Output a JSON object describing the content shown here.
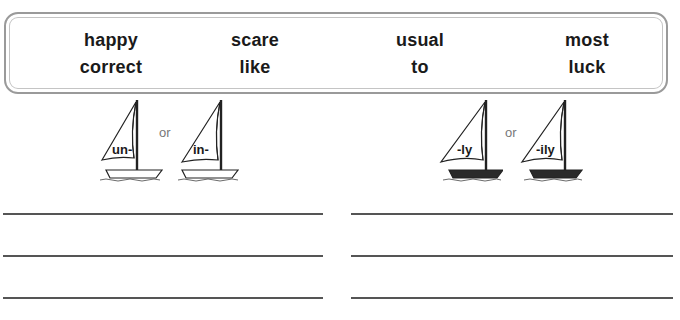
{
  "word_box": {
    "columns": [
      {
        "top": "happy",
        "bottom": "correct"
      },
      {
        "top": "scare",
        "bottom": "like"
      },
      {
        "top": "usual",
        "bottom": "to"
      },
      {
        "top": "most",
        "bottom": "luck"
      }
    ]
  },
  "prefix_group": {
    "boats": [
      {
        "label": "un-"
      },
      {
        "label": "in-"
      }
    ],
    "separator": "or"
  },
  "suffix_group": {
    "boats": [
      {
        "label": "-ly"
      },
      {
        "label": "-ily"
      }
    ],
    "separator": "or"
  },
  "answer_lines": {
    "left_count": 3,
    "right_count": 3
  }
}
